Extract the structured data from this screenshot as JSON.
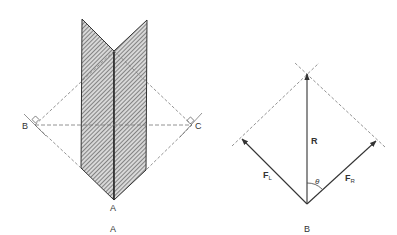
{
  "panel_a": {
    "caption": "A",
    "points": {
      "apex_label": "A",
      "left_label": "B",
      "right_label": "C"
    }
  },
  "panel_b": {
    "caption": "B",
    "vectors": {
      "resultant": "R",
      "left_force_main": "F",
      "left_force_sub": "L",
      "right_force_main": "F",
      "right_force_sub": "R"
    },
    "angle_label": "θ"
  },
  "colors": {
    "line": "#333333",
    "hatch_fill": "#9a9a9a",
    "dashed": "#777777",
    "background": "#ffffff"
  }
}
